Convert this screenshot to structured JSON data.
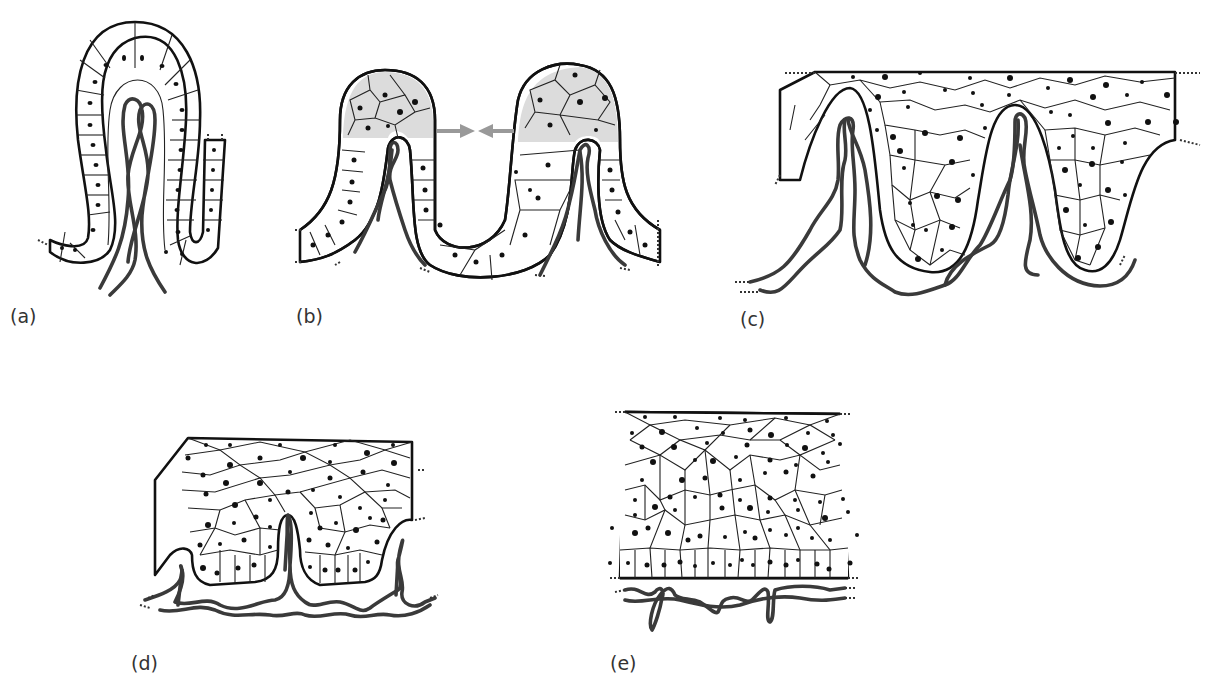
{
  "figure": {
    "panels": [
      {
        "id": "a",
        "label": "(a)",
        "content": "Single tall columnar epithelial fold with twisted capillary loop inside"
      },
      {
        "id": "b",
        "label": "(b)",
        "content": "Two adjacent folds; shaded stratified cells at fold tips; arrows pointing toward each other"
      },
      {
        "id": "c",
        "label": "(c)",
        "content": "Stratified epithelium filling between folds; capillaries beneath"
      },
      {
        "id": "d",
        "label": "(d)",
        "content": "Shallow undulating basal layer with short papillae and capillaries"
      },
      {
        "id": "e",
        "label": "(e)",
        "content": "Flat stratified epithelium with straight basal layer; capillary plexus below"
      }
    ],
    "arrows": {
      "count": 2,
      "direction": "converging",
      "color": "#999999"
    },
    "colors": {
      "outline": "#111111",
      "vessel": "#3a3a3a",
      "shade": "#dcdcdc",
      "background": "#ffffff"
    }
  }
}
